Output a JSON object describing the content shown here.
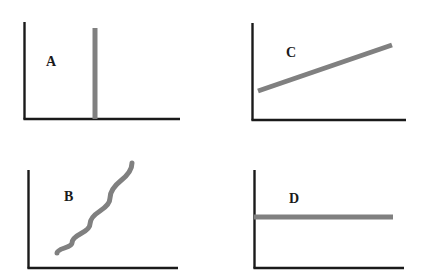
{
  "figure": {
    "title": "",
    "background_color": "#ffffff",
    "axis_color": "#1a1a1a",
    "data_color": "#808080",
    "label_color": "#1a1a1a",
    "width": 428,
    "height": 280,
    "panel_count": 4
  },
  "panels": [
    {
      "id": "a",
      "label": "A",
      "label_position": {
        "x": 46,
        "y": 55
      },
      "curve_type": "vertical-line",
      "description": "vertical bar at a single x value spanning full plot height",
      "axes": {
        "origin": {
          "x": 24,
          "y": 119
        },
        "y_axis_top": 22,
        "x_axis_right": 180
      },
      "data": {
        "x": [
          95,
          95
        ],
        "y": [
          119,
          28
        ]
      }
    },
    {
      "id": "b",
      "label": "B",
      "label_position": {
        "x": 64,
        "y": 190
      },
      "curve_type": "exponential-increasing",
      "description": "upward concave curve rising steeply to the right",
      "axes": {
        "origin": {
          "x": 28,
          "y": 268
        },
        "y_axis_top": 170,
        "x_axis_right": 178
      },
      "data": {
        "x": [
          57,
          72,
          90,
          110,
          132
        ],
        "y": [
          253,
          243,
          224,
          198,
          163
        ]
      }
    },
    {
      "id": "c",
      "label": "C",
      "label_position": {
        "x": 286,
        "y": 46
      },
      "curve_type": "linear-increasing",
      "description": "straight line with positive slope",
      "axes": {
        "origin": {
          "x": 252,
          "y": 120
        },
        "y_axis_top": 23,
        "x_axis_right": 406
      },
      "data": {
        "x": [
          258,
          392
        ],
        "y": [
          91,
          45
        ]
      }
    },
    {
      "id": "d",
      "label": "D",
      "label_position": {
        "x": 289,
        "y": 192
      },
      "curve_type": "constant",
      "description": "flat horizontal line at constant value",
      "axes": {
        "origin": {
          "x": 254,
          "y": 268
        },
        "y_axis_top": 170,
        "x_axis_right": 404
      },
      "data": {
        "x": [
          254,
          393
        ],
        "y": [
          217,
          217
        ]
      }
    }
  ],
  "chart_data": {
    "type": "line",
    "title": "",
    "xlabel": "",
    "ylabel": "",
    "grid": false,
    "legend": "none",
    "subplots": [
      {
        "name": "A",
        "shape": "vertical line / spike",
        "x": [
          1,
          1
        ],
        "y": [
          0,
          1
        ],
        "xlim": [
          0,
          2
        ],
        "ylim": [
          0,
          1
        ]
      },
      {
        "name": "B",
        "shape": "exponential growth",
        "x": [
          0.2,
          0.4,
          0.6,
          0.8,
          1.0
        ],
        "y": [
          0.1,
          0.2,
          0.4,
          0.65,
          1.0
        ],
        "xlim": [
          0,
          1.4
        ],
        "ylim": [
          0,
          1.1
        ]
      },
      {
        "name": "C",
        "shape": "linear increase",
        "x": [
          0.05,
          0.9
        ],
        "y": [
          0.3,
          0.77
        ],
        "xlim": [
          0,
          1
        ],
        "ylim": [
          0,
          1
        ]
      },
      {
        "name": "D",
        "shape": "constant",
        "x": [
          0,
          1
        ],
        "y": [
          0.52,
          0.52
        ],
        "xlim": [
          0,
          1
        ],
        "ylim": [
          0,
          1
        ]
      }
    ]
  }
}
